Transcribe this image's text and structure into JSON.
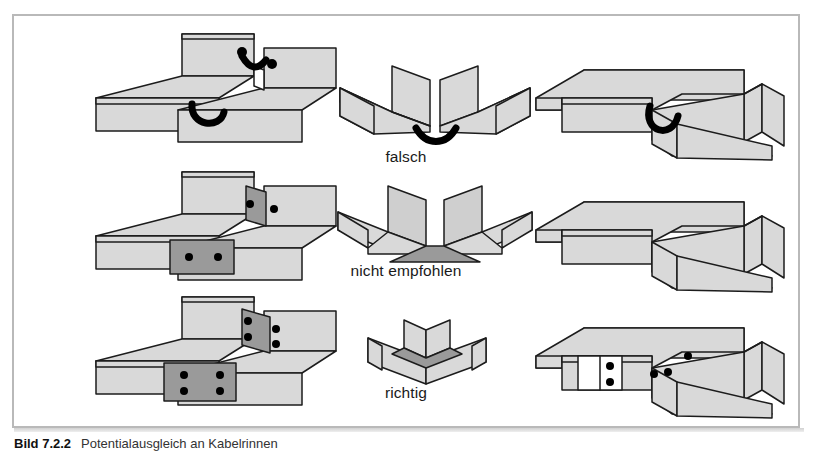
{
  "figure": {
    "frame_border_color": "#b9b9b9",
    "background_color": "#ffffff",
    "caption_number": "Bild 7.2.2",
    "caption_text": "Potentialausgleich an Kabelrinnen"
  },
  "palette": {
    "channel_fill": "#d9d9d9",
    "plate_fill": "#9a9a9a",
    "outline": "#1c1c1c",
    "jumper": "#000000",
    "label_text": "#1a1a1a"
  },
  "row_labels": [
    {
      "id": "falsch",
      "label": "falsch"
    },
    {
      "id": "nicht-empfohlen",
      "label": "nicht empfohlen"
    },
    {
      "id": "richtig",
      "label": "richtig"
    }
  ],
  "rows": [
    {
      "id": "row-falsch",
      "label": "falsch",
      "cells": [
        {
          "id": "straight-joint-jumper",
          "column": "left",
          "view": "isometric",
          "joint_type": "straight-butt-joint",
          "bond_method": "flexible-jumper-strap",
          "jumper_count": 2,
          "bolt_count": 2,
          "splice_plate": false
        },
        {
          "id": "section-gap-jumper",
          "column": "center",
          "view": "cross-section",
          "joint_type": "separated-channel-ends",
          "bond_method": "flexible-jumper-strap",
          "jumper_count": 1,
          "contact_area": "none"
        },
        {
          "id": "tee-joint-jumper",
          "column": "right",
          "view": "isometric",
          "joint_type": "tee-branch",
          "bond_method": "flexible-jumper-strap",
          "jumper_count": 1,
          "splice_plate": false
        }
      ]
    },
    {
      "id": "row-nicht-empfohlen",
      "label": "nicht empfohlen",
      "cells": [
        {
          "id": "straight-joint-small-plate",
          "column": "left",
          "view": "isometric",
          "joint_type": "straight-butt-joint",
          "bond_method": "two-bolt-splice-plate",
          "jumper_count": 0,
          "bolt_count": 4,
          "splice_plate": true
        },
        {
          "id": "section-overlap-contact",
          "column": "center",
          "view": "cross-section",
          "joint_type": "overlapping-channel-ends",
          "bond_method": "surface-contact-only",
          "jumper_count": 0,
          "contact_area": "base-only"
        },
        {
          "id": "tee-joint-contact",
          "column": "right",
          "view": "isometric",
          "joint_type": "tee-branch",
          "bond_method": "surface-contact-only",
          "jumper_count": 0,
          "splice_plate": false
        }
      ]
    },
    {
      "id": "row-richtig",
      "label": "richtig",
      "cells": [
        {
          "id": "straight-joint-large-plate",
          "column": "left",
          "view": "isometric",
          "joint_type": "straight-butt-joint",
          "bond_method": "four-bolt-splice-plate",
          "jumper_count": 0,
          "bolt_count": 8,
          "splice_plate": true
        },
        {
          "id": "section-nested-full",
          "column": "center",
          "view": "cross-section",
          "joint_type": "fully-nested-channel-ends",
          "bond_method": "full-surface-contact",
          "jumper_count": 0,
          "contact_area": "full-profile"
        },
        {
          "id": "tee-joint-bolted",
          "column": "right",
          "view": "isometric",
          "joint_type": "tee-branch",
          "bond_method": "bolted-connection-plates",
          "jumper_count": 0,
          "bolt_count": 5,
          "splice_plate": true
        }
      ]
    }
  ]
}
